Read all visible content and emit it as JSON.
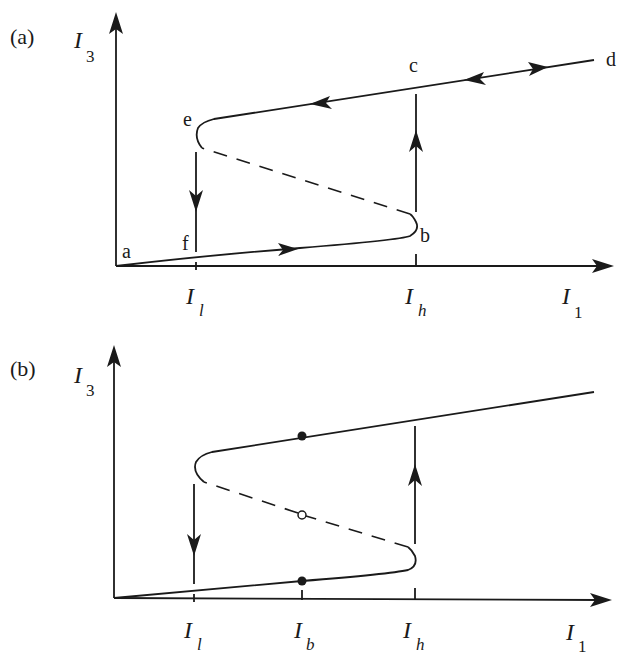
{
  "panels": [
    {
      "id": "a",
      "label": "(a)",
      "y_axis_label": "I",
      "y_axis_sub": "3",
      "x_axis_label": "I",
      "x_axis_sub": "1",
      "ticks": [
        {
          "name": "I",
          "sub": "l"
        },
        {
          "name": "I",
          "sub": "h"
        }
      ],
      "points": {
        "a": "a",
        "b": "b",
        "c": "c",
        "d": "d",
        "e": "e",
        "f": "f"
      }
    },
    {
      "id": "b",
      "label": "(b)",
      "y_axis_label": "I",
      "y_axis_sub": "3",
      "x_axis_label": "I",
      "x_axis_sub": "1",
      "ticks": [
        {
          "name": "I",
          "sub": "l"
        },
        {
          "name": "I",
          "sub": "b"
        },
        {
          "name": "I",
          "sub": "h"
        }
      ]
    }
  ],
  "legend": {
    "solid_line": "stable branch",
    "dashed_line": "unstable branch",
    "filled_dot": "stable equilibrium",
    "open_dot": "unstable equilibrium"
  }
}
